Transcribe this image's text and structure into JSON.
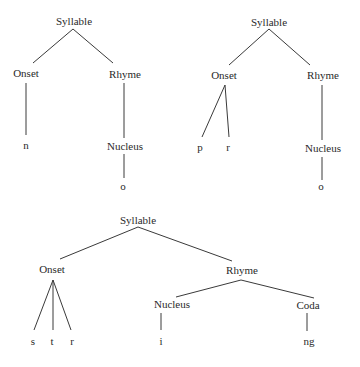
{
  "diagram": {
    "type": "syllable-structure-trees",
    "trees": [
      {
        "id": "tree-no",
        "root": "Syllable",
        "onset": {
          "label": "Onset",
          "segments": [
            "n"
          ]
        },
        "rhyme": {
          "label": "Rhyme",
          "nucleus": {
            "label": "Nucleus",
            "segments": [
              "o"
            ]
          }
        }
      },
      {
        "id": "tree-pro",
        "root": "Syllable",
        "onset": {
          "label": "Onset",
          "segments": [
            "p",
            "r"
          ]
        },
        "rhyme": {
          "label": "Rhyme",
          "nucleus": {
            "label": "Nucleus",
            "segments": [
              "o"
            ]
          }
        }
      },
      {
        "id": "tree-string",
        "root": "Syllable",
        "onset": {
          "label": "Onset",
          "segments": [
            "s",
            "t",
            "r"
          ]
        },
        "rhyme": {
          "label": "Rhyme",
          "nucleus": {
            "label": "Nucleus",
            "segments": [
              "i"
            ]
          },
          "coda": {
            "label": "Coda",
            "segments": [
              "ng"
            ]
          }
        }
      }
    ]
  }
}
